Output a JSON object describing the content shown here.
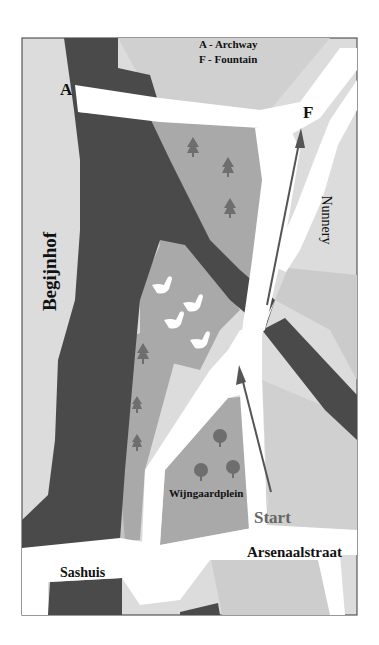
{
  "legend": {
    "line1": "A - Archway",
    "line2": "F - Fountain"
  },
  "markers": {
    "archway": "A",
    "fountain": "F",
    "start": "Start"
  },
  "places": {
    "begijnhof": "Begijnhof",
    "nunnery": "Nunnery",
    "wijngaardplein": "Wijngaardplein",
    "arsenaalstraat": "Arsenaalstraat",
    "sashuis": "Sashuis"
  },
  "colors": {
    "water": "#4a4a4a",
    "park": "#a9a9a9",
    "building_light": "#dcdcdc",
    "building_mid": "#c6c6c6",
    "road": "#ffffff",
    "tree": "#6e6e6e",
    "route_arrow": "#555555",
    "start_text": "#666666",
    "frame": "#555555"
  }
}
